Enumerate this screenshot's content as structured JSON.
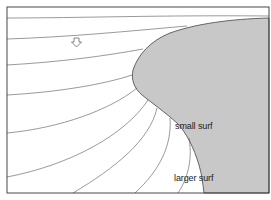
{
  "diagram": {
    "labels": {
      "small_surf": "small surf",
      "larger_surf": "larger surf"
    },
    "icons": {
      "wave_direction": "down-arrow-icon"
    },
    "colors": {
      "land": "#c8c8c8",
      "lines": "#555555",
      "frame": "#333333",
      "background": "#ffffff"
    }
  }
}
